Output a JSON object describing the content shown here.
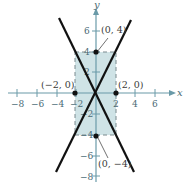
{
  "diagram": {
    "type": "hyperbola-asymptotes",
    "axes": {
      "x_label": "x",
      "y_label": "y",
      "x_ticks": [
        {
          "value": -8,
          "label": "−8"
        },
        {
          "value": -6,
          "label": "−6"
        },
        {
          "value": -4,
          "label": "−4"
        },
        {
          "value": -2,
          "label": "−2"
        },
        {
          "value": 2,
          "label": "2"
        },
        {
          "value": 4,
          "label": "4"
        },
        {
          "value": 6,
          "label": "6"
        }
      ],
      "y_ticks": [
        {
          "value": 6,
          "label": "6"
        },
        {
          "value": 4,
          "label": "4"
        },
        {
          "value": 2,
          "label": "2"
        },
        {
          "value": -2,
          "label": "−2"
        },
        {
          "value": -4,
          "label": "−4"
        },
        {
          "value": -6,
          "label": "−6"
        },
        {
          "value": -8,
          "label": "−8"
        }
      ]
    },
    "points": [
      {
        "x": 0,
        "y": 4,
        "label": "(0, 4)"
      },
      {
        "x": -2,
        "y": 0,
        "label": "(−2, 0)"
      },
      {
        "x": 2,
        "y": 0,
        "label": "(2, 0)"
      },
      {
        "x": 0,
        "y": -4,
        "label": "(0, −4)"
      }
    ],
    "rectangle": {
      "x_min": -2,
      "x_max": 2,
      "y_min": -4,
      "y_max": 4
    },
    "asymptotes": [
      {
        "equation": "y = 2x"
      },
      {
        "equation": "y = -2x"
      }
    ],
    "colors": {
      "axis": "#6a9aa8",
      "fill": "#cfe3e6",
      "line": "#111111",
      "point": "#111111",
      "dash": "#7a8a8e"
    }
  }
}
